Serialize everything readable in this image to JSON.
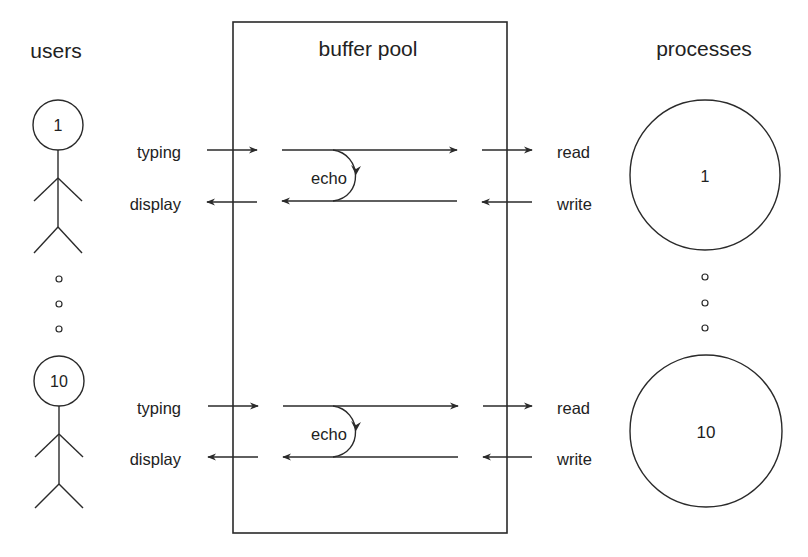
{
  "headers": {
    "users": "users",
    "buffer_pool": "buffer pool",
    "processes": "processes"
  },
  "colors": {
    "ink": "#2a2a2a",
    "background": "#ffffff"
  },
  "buffer_pool_box": {
    "x": 233,
    "y": 22,
    "width": 274,
    "height": 511
  },
  "users": [
    {
      "id": "1",
      "label": "1",
      "cx": 58,
      "cy": 125,
      "r": 25
    },
    {
      "id": "10",
      "label": "10",
      "cx": 59,
      "cy": 381,
      "r": 25
    }
  ],
  "user_ellipsis_dots": [
    {
      "cx": 59,
      "cy": 279
    },
    {
      "cx": 59,
      "cy": 304
    },
    {
      "cx": 59,
      "cy": 329
    }
  ],
  "processes": [
    {
      "id": "1",
      "label": "1",
      "cx": 705,
      "cy": 175,
      "r": 75
    },
    {
      "id": "10",
      "label": "10",
      "cx": 705,
      "cy": 431,
      "r": 76
    }
  ],
  "process_ellipsis_dots": [
    {
      "cx": 705,
      "cy": 277
    },
    {
      "cx": 705,
      "cy": 303
    },
    {
      "cx": 705,
      "cy": 328
    }
  ],
  "rows": [
    {
      "top_y": 150,
      "bottom_y": 202,
      "typing_label": "typing",
      "display_label": "display",
      "echo_label": "echo",
      "read_label": "read",
      "write_label": "write"
    },
    {
      "top_y": 406,
      "bottom_y": 457,
      "typing_label": "typing",
      "display_label": "display",
      "echo_label": "echo",
      "read_label": "read",
      "write_label": "write"
    }
  ],
  "flows": {
    "user_to_pool": "typing",
    "pool_to_user": "display",
    "internal_loop": "echo",
    "pool_to_process": "read",
    "process_to_pool": "write"
  }
}
